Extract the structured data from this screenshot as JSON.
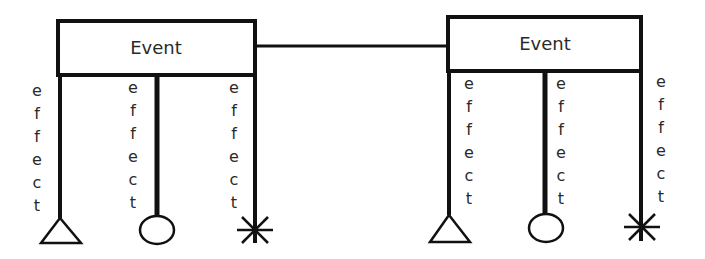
{
  "diagram": {
    "colors": {
      "stroke": "#111111",
      "text": "#2a2a2a",
      "background": "#ffffff"
    },
    "connector": {
      "from": "event-left",
      "to": "event-right"
    },
    "events": [
      {
        "id": "event-left",
        "title": "Event",
        "effects": [
          {
            "label": "effect",
            "letters": [
              "e",
              "f",
              "f",
              "e",
              "c",
              "t"
            ],
            "terminator": "triangle"
          },
          {
            "label": "effect",
            "letters": [
              "e",
              "f",
              "f",
              "e",
              "c",
              "t"
            ],
            "terminator": "circle"
          },
          {
            "label": "effect",
            "letters": [
              "e",
              "f",
              "f",
              "e",
              "c",
              "t"
            ],
            "terminator": "asterisk"
          }
        ]
      },
      {
        "id": "event-right",
        "title": "Event",
        "effects": [
          {
            "label": "effect",
            "letters": [
              "e",
              "f",
              "f",
              "e",
              "c",
              "t"
            ],
            "terminator": "triangle"
          },
          {
            "label": "effect",
            "letters": [
              "e",
              "f",
              "f",
              "e",
              "c",
              "t"
            ],
            "terminator": "circle"
          },
          {
            "label": "effect",
            "letters": [
              "e",
              "f",
              "f",
              "e",
              "c",
              "t"
            ],
            "terminator": "asterisk"
          }
        ]
      }
    ]
  }
}
